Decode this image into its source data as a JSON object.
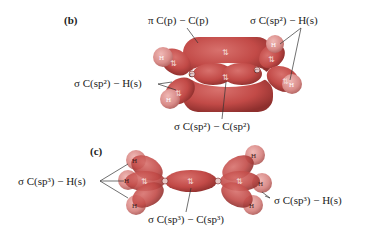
{
  "panels": [
    {
      "label": "(b)",
      "molecule": "ethylene",
      "annotations": {
        "pi_bond": "π C(p) − C(p)",
        "sigma_ch_right": "σ C(sp²) − H(s)",
        "sigma_ch_left": "σ C(sp²) − H(s)",
        "sigma_cc": "σ C(sp²) − C(sp²)"
      },
      "atoms": {
        "carbon": "C",
        "hydrogen": "H"
      },
      "electron_pair_glyph": "⇅"
    },
    {
      "label": "(c)",
      "molecule": "ethane",
      "annotations": {
        "sigma_ch_left": "σ C(sp³) − H(s)",
        "sigma_ch_right": "σ C(sp³) − H(s)",
        "sigma_cc": "σ C(sp³) − C(sp³)"
      },
      "atoms": {
        "carbon": "C",
        "hydrogen": "H"
      },
      "electron_pair_glyph": "⇅"
    }
  ],
  "colors": {
    "orbital": "#c24a47",
    "orbital_dark": "#9e3432",
    "hydrogen": "#d98c89",
    "leader_line": "#333333"
  }
}
